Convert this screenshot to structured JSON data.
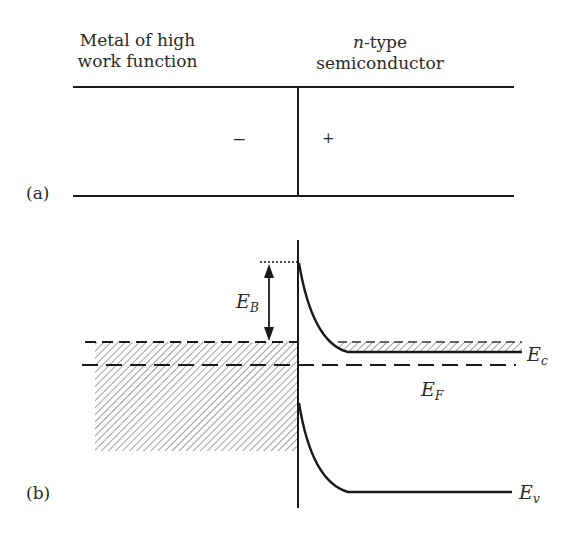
{
  "panel_a": {
    "label": "(a)",
    "left_title_line1": "Metal of high",
    "left_title_line2": "work function",
    "right_title_italic": "n",
    "right_title_line1_rest": "-type",
    "right_title_line2": "semiconductor",
    "left_charge": "−",
    "right_charge": "+"
  },
  "panel_b": {
    "label": "(b)",
    "barrier_label": "E",
    "barrier_sub": "B",
    "conduction_label": "E",
    "conduction_sub": "c",
    "fermi_label": "E",
    "fermi_sub": "F",
    "valence_label": "E",
    "valence_sub": "v"
  },
  "colors": {
    "line": "#1a1a1a",
    "hatch": "#6a6a6a",
    "text": "#2a2a2a"
  }
}
